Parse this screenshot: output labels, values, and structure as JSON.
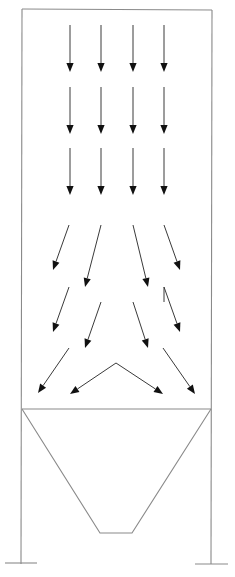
{
  "diagram": {
    "title": "",
    "colors": {
      "structure": "#8a8a8a",
      "arrow_line": "#3a3a3a",
      "arrow_head": "#111111",
      "background": "#ffffff"
    },
    "housing": {
      "top_left": [
        22,
        9
      ],
      "top_right": [
        212,
        10
      ],
      "hopper_top_y": 409,
      "left_leg_x": 21,
      "right_leg_x": 211,
      "leg_bottom_y": 564
    },
    "hopper": {
      "top_left": [
        22,
        409
      ],
      "top_right": [
        211,
        409
      ],
      "bottom_left": [
        100,
        533
      ],
      "bottom_right": [
        132,
        533
      ]
    },
    "footings": [
      {
        "name": "left-footing",
        "x1": 5,
        "x2": 37,
        "y": 563
      },
      {
        "name": "right-footing",
        "x1": 195,
        "x2": 228,
        "y": 564
      }
    ],
    "arrows": [
      {
        "name": "row1-col1",
        "x1": 70,
        "y1": 25,
        "x2": 70,
        "y2": 72
      },
      {
        "name": "row1-col2",
        "x1": 101,
        "y1": 25,
        "x2": 101,
        "y2": 72
      },
      {
        "name": "row1-col3",
        "x1": 133,
        "y1": 25,
        "x2": 133,
        "y2": 72
      },
      {
        "name": "row1-col4",
        "x1": 164,
        "y1": 25,
        "x2": 164,
        "y2": 72
      },
      {
        "name": "row2-col1",
        "x1": 70,
        "y1": 87,
        "x2": 70,
        "y2": 134
      },
      {
        "name": "row2-col2",
        "x1": 101,
        "y1": 87,
        "x2": 101,
        "y2": 134
      },
      {
        "name": "row2-col3",
        "x1": 133,
        "y1": 87,
        "x2": 133,
        "y2": 134
      },
      {
        "name": "row2-col4",
        "x1": 164,
        "y1": 87,
        "x2": 164,
        "y2": 134
      },
      {
        "name": "row3-col1",
        "x1": 70,
        "y1": 148,
        "x2": 70,
        "y2": 195
      },
      {
        "name": "row3-col2",
        "x1": 101,
        "y1": 148,
        "x2": 101,
        "y2": 195
      },
      {
        "name": "row3-col3",
        "x1": 133,
        "y1": 148,
        "x2": 133,
        "y2": 195
      },
      {
        "name": "row3-col4",
        "x1": 164,
        "y1": 148,
        "x2": 164,
        "y2": 195
      },
      {
        "name": "row4-col1",
        "x1": 69,
        "y1": 225,
        "x2": 53,
        "y2": 270
      },
      {
        "name": "row4-col2",
        "x1": 101,
        "y1": 225,
        "x2": 85,
        "y2": 287
      },
      {
        "name": "row4-col3",
        "x1": 133,
        "y1": 225,
        "x2": 148,
        "y2": 287
      },
      {
        "name": "row4-col4",
        "x1": 164,
        "y1": 225,
        "x2": 180,
        "y2": 270
      },
      {
        "name": "row5-col1",
        "x1": 69,
        "y1": 287,
        "x2": 53,
        "y2": 332
      },
      {
        "name": "row5-col2",
        "x1": 101,
        "y1": 302,
        "x2": 85,
        "y2": 348
      },
      {
        "name": "row5-col3",
        "x1": 133,
        "y1": 302,
        "x2": 148,
        "y2": 348
      },
      {
        "name": "row5-col4",
        "x1": 164,
        "y1": 287,
        "x2": 180,
        "y2": 332
      },
      {
        "name": "row6-left-outer",
        "x1": 69,
        "y1": 348,
        "x2": 38,
        "y2": 393
      },
      {
        "name": "row6-center-left",
        "x1": 116,
        "y1": 363,
        "x2": 70,
        "y2": 394
      },
      {
        "name": "row6-center-right",
        "x1": 116,
        "y1": 363,
        "x2": 163,
        "y2": 394
      },
      {
        "name": "row6-right-outer",
        "x1": 163,
        "y1": 348,
        "x2": 195,
        "y2": 394
      }
    ],
    "extra_marks": [
      {
        "name": "row5-col4-tick",
        "x1": 164,
        "y1": 287,
        "x2": 164,
        "y2": 302
      }
    ]
  }
}
